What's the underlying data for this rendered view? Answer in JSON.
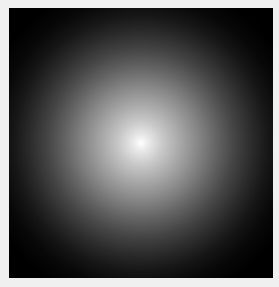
{
  "image": {
    "subject": "radial white glow on black background",
    "colors": {
      "background": "#000000",
      "center": "#ffffff",
      "border": "#f0f0f0"
    }
  }
}
